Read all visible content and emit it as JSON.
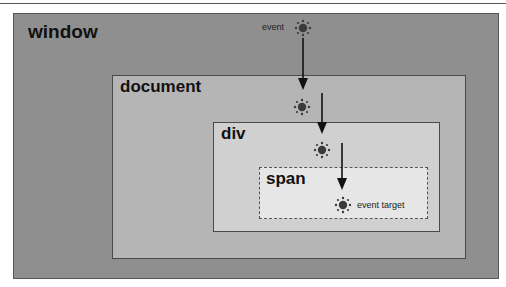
{
  "diagram": {
    "boxes": {
      "window": {
        "label": "window"
      },
      "document": {
        "label": "document"
      },
      "div": {
        "label": "div"
      },
      "span": {
        "label": "span"
      }
    },
    "annotations": {
      "event": "event",
      "event_target": "event target"
    },
    "icons": [
      {
        "name": "event-icon",
        "x": 303,
        "y": 28
      },
      {
        "name": "document-event-icon",
        "x": 302,
        "y": 107
      },
      {
        "name": "div-event-icon",
        "x": 322,
        "y": 150
      },
      {
        "name": "target-event-icon",
        "x": 343,
        "y": 205
      }
    ],
    "colors": {
      "window_fill": "#8f8f8f",
      "document_fill": "#b5b5b5",
      "div_fill": "#d0d0d0",
      "span_fill": "#e6e6e6",
      "arrow": "#111111",
      "icon": "#3a3a3a"
    }
  }
}
